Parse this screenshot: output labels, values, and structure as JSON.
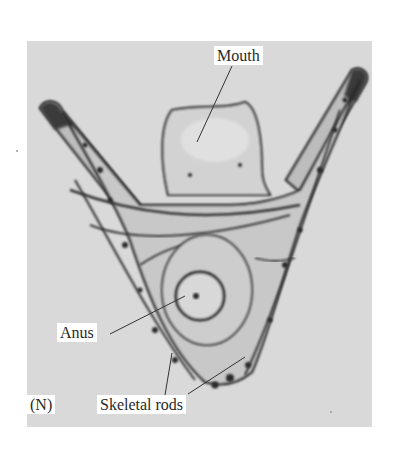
{
  "figure": {
    "panel_id": "(N)",
    "colors": {
      "background": "#d9d9d9",
      "label_box": "#ffffff",
      "text": "#2a2a2a",
      "leader_line": "#333333",
      "specimen_dark": "#2b2b2b"
    },
    "labels": [
      {
        "id": "mouth",
        "text": "Mouth",
        "box": {
          "x": 215,
          "y": 46
        },
        "leader": {
          "x1": 232,
          "y1": 66,
          "x2": 197,
          "y2": 142
        }
      },
      {
        "id": "anus",
        "text": "Anus",
        "box": {
          "x": 58,
          "y": 322
        },
        "leader": {
          "x1": 110,
          "y1": 334,
          "x2": 185,
          "y2": 296
        }
      },
      {
        "id": "skeletal-rods",
        "text": "Skeletal rods",
        "box": {
          "x": 97,
          "y": 394
        },
        "leader_a": {
          "x1": 165,
          "y1": 395,
          "x2": 172,
          "y2": 353
        },
        "leader_b": {
          "x1": 188,
          "y1": 394,
          "x2": 245,
          "y2": 357
        }
      }
    ]
  }
}
